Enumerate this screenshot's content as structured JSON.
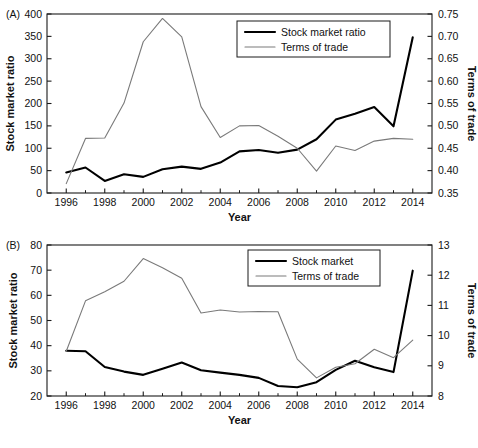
{
  "figure": {
    "background": "#ffffff",
    "primary_color": "#000000",
    "secondary_color": "#7a7a7a",
    "axis_color": "#1a1a1a"
  },
  "panels": [
    {
      "letter": "(A)",
      "xlabel": "Year",
      "ylabel_left": "Stock market ratio",
      "ylabel_right": "Terms of trade",
      "legend": [
        "Stock market ratio",
        "Terms of trade"
      ]
    },
    {
      "letter": "(B)",
      "xlabel": "Year",
      "ylabel_left": "Stock market ratio",
      "ylabel_right": "Terms of trade",
      "legend": [
        "Stock market",
        "Terms of trade"
      ]
    }
  ],
  "chart_data": [
    {
      "type": "line",
      "title": "",
      "panel": "(A)",
      "xlabel": "Year",
      "ylabel": "Stock market ratio",
      "ylabel_right": "Terms of trade",
      "grid": false,
      "legend_position": "top-right",
      "x": [
        1996,
        1997,
        1998,
        1999,
        2000,
        2001,
        2002,
        2003,
        2004,
        2005,
        2006,
        2007,
        2008,
        2009,
        2010,
        2011,
        2012,
        2013,
        2014
      ],
      "xticks": [
        1996,
        1998,
        2000,
        2002,
        2004,
        2006,
        2008,
        2010,
        2012,
        2014
      ],
      "xlim": [
        1995,
        2015
      ],
      "ylim": [
        0,
        400
      ],
      "yticks": [
        0,
        50,
        100,
        150,
        200,
        250,
        300,
        350,
        400
      ],
      "ylim_right": [
        0.35,
        0.75
      ],
      "yticks_right": [
        0.35,
        0.4,
        0.45,
        0.5,
        0.55,
        0.6,
        0.65,
        0.7,
        0.75
      ],
      "series": [
        {
          "name": "Stock market ratio",
          "axis": "left",
          "color": "#000000",
          "values": [
            46,
            57,
            27,
            42,
            36,
            53,
            59,
            54,
            68,
            93,
            96,
            90,
            97,
            120,
            164,
            177,
            192,
            149,
            348
          ]
        },
        {
          "name": "Terms of trade",
          "axis": "right",
          "color": "#7a7a7a",
          "values": [
            0.371,
            0.472,
            0.473,
            0.551,
            0.688,
            0.74,
            0.699,
            0.543,
            0.474,
            0.5,
            0.501,
            0.477,
            0.45,
            0.399,
            0.455,
            0.445,
            0.466,
            0.472,
            0.47
          ]
        }
      ]
    },
    {
      "type": "line",
      "title": "",
      "panel": "(B)",
      "xlabel": "Year",
      "ylabel": "Stock market ratio",
      "ylabel_right": "Terms of trade",
      "grid": false,
      "legend_position": "top-right",
      "x": [
        1996,
        1997,
        1998,
        1999,
        2000,
        2001,
        2002,
        2003,
        2004,
        2005,
        2006,
        2007,
        2008,
        2009,
        2010,
        2011,
        2012,
        2013,
        2014
      ],
      "xticks": [
        1996,
        1998,
        2000,
        2002,
        2004,
        2006,
        2008,
        2010,
        2012,
        2014
      ],
      "xlim": [
        1995,
        2015
      ],
      "ylim": [
        20,
        80
      ],
      "yticks": [
        20,
        30,
        40,
        50,
        60,
        70,
        80
      ],
      "ylim_right": [
        8,
        13
      ],
      "yticks_right": [
        8,
        9,
        10,
        11,
        12,
        13
      ],
      "series": [
        {
          "name": "Stock market",
          "axis": "left",
          "color": "#000000",
          "values": [
            38.0,
            37.8,
            31.5,
            29.7,
            28.4,
            30.8,
            33.3,
            30.2,
            29.3,
            28.4,
            27.2,
            24.0,
            23.5,
            25.5,
            30.4,
            34.0,
            31.4,
            29.5,
            69.8
          ]
        },
        {
          "name": "Terms of trade",
          "axis": "right",
          "color": "#7a7a7a",
          "values": [
            9.48,
            11.15,
            11.45,
            11.8,
            12.55,
            12.25,
            11.9,
            10.75,
            10.85,
            10.78,
            10.8,
            10.79,
            9.22,
            8.6,
            8.95,
            9.07,
            9.55,
            9.27,
            9.85
          ]
        }
      ]
    }
  ]
}
